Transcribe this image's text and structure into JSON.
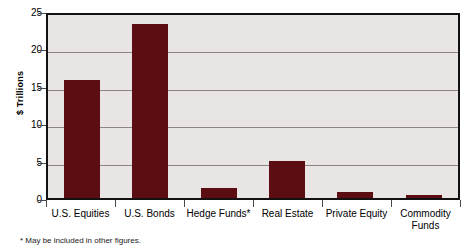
{
  "chart_data": {
    "type": "bar",
    "title": "",
    "xlabel": "",
    "ylabel": "$ Trillions",
    "categories": [
      "U.S. Equities",
      "U.S. Bonds",
      "Hedge Funds*",
      "Real Estate",
      "Private Equity",
      "Commodity Funds"
    ],
    "values": [
      15.8,
      23.2,
      1.4,
      5.0,
      0.8,
      0.4
    ],
    "ylim": [
      0,
      25
    ],
    "yticks": [
      0,
      5,
      10,
      15,
      20,
      25
    ],
    "ytick_labels": [
      "0",
      "5",
      "10",
      "15",
      "20",
      "25"
    ],
    "grid": true,
    "legend": "none",
    "bar_color": "#5c0d11",
    "plot_background": "#eae5e5",
    "gridline_color": "#8e8484",
    "axis_color": "#121212",
    "footnote": "* May be included in other figures.",
    "category_labels_wrapped": [
      [
        "U.S. Equities"
      ],
      [
        "U.S. Bonds"
      ],
      [
        "Hedge Funds*"
      ],
      [
        "Real Estate"
      ],
      [
        "Private Equity"
      ],
      [
        "Commodity",
        "Funds"
      ]
    ]
  }
}
